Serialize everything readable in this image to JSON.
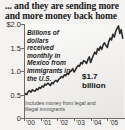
{
  "headline": "... and they are sending more and more money back home",
  "annotation": "Billions of dollars received monthly in Mexico from immigrants in the U.S.",
  "callout_value": "$1.7",
  "callout_unit": "billion",
  "footnote": "Includes money from legal and illegal immigrants",
  "colors": {
    "line": "#2c2c2c",
    "axis": "#6e6c68",
    "text": "#1a1a1a",
    "background": "#f4f3f1"
  },
  "chart_data": {
    "type": "line",
    "title": "... and they are sending more and more money back home",
    "subtitle": "Billions of dollars received monthly in Mexico from immigrants in the U.S.",
    "xlabel": "",
    "ylabel": "Billions of dollars per month",
    "ylim": [
      0,
      2.0
    ],
    "yticks": [
      0,
      0.5,
      1.0,
      1.5,
      2.0
    ],
    "ytick_labels": [
      "0",
      "0.5",
      "1.0",
      "1.5",
      "$2.0"
    ],
    "xticks": [
      2000,
      2001,
      2002,
      2003,
      2004,
      2005
    ],
    "xtick_labels": [
      "'00",
      "'01",
      "'02",
      "'03",
      "'04",
      "'05"
    ],
    "grid": false,
    "legend": null,
    "annotations": [
      {
        "text": "$1.7 billion",
        "x": 2005.6,
        "y": 1.7
      },
      {
        "text": "Includes money from legal and illegal immigrants",
        "x": 2000.2,
        "y": 0.18
      }
    ],
    "series": [
      {
        "name": "Monthly remittances to Mexico",
        "x": [
          2000.0,
          2000.08,
          2000.17,
          2000.25,
          2000.33,
          2000.42,
          2000.5,
          2000.58,
          2000.67,
          2000.75,
          2000.83,
          2000.92,
          2001.0,
          2001.08,
          2001.17,
          2001.25,
          2001.33,
          2001.42,
          2001.5,
          2001.58,
          2001.67,
          2001.75,
          2001.83,
          2001.92,
          2002.0,
          2002.08,
          2002.17,
          2002.25,
          2002.33,
          2002.42,
          2002.5,
          2002.58,
          2002.67,
          2002.75,
          2002.83,
          2002.92,
          2003.0,
          2003.08,
          2003.17,
          2003.25,
          2003.33,
          2003.42,
          2003.5,
          2003.58,
          2003.67,
          2003.75,
          2003.83,
          2003.92,
          2004.0,
          2004.08,
          2004.17,
          2004.25,
          2004.33,
          2004.42,
          2004.5,
          2004.58,
          2004.67,
          2004.75,
          2004.83,
          2004.92,
          2005.0,
          2005.08,
          2005.17,
          2005.25,
          2005.33,
          2005.42,
          2005.5,
          2005.58,
          2005.67,
          2005.75,
          2005.83,
          2005.92
        ],
        "values": [
          0.47,
          0.52,
          0.5,
          0.56,
          0.58,
          0.55,
          0.6,
          0.58,
          0.57,
          0.62,
          0.6,
          0.65,
          0.63,
          0.68,
          0.66,
          0.72,
          0.7,
          0.74,
          0.72,
          0.69,
          0.75,
          0.73,
          0.78,
          0.8,
          0.77,
          0.82,
          0.85,
          0.88,
          0.86,
          0.92,
          0.9,
          0.95,
          0.93,
          0.98,
          1.0,
          1.05,
          0.98,
          1.02,
          1.08,
          1.12,
          1.1,
          1.18,
          1.15,
          1.22,
          1.2,
          1.16,
          1.24,
          1.3,
          1.18,
          1.26,
          1.34,
          1.4,
          1.36,
          1.48,
          1.44,
          1.52,
          1.46,
          1.56,
          1.6,
          1.54,
          1.5,
          1.62,
          1.7,
          1.66,
          1.78,
          1.72,
          1.84,
          1.9,
          1.96,
          1.8,
          1.88,
          1.7
        ]
      }
    ]
  }
}
